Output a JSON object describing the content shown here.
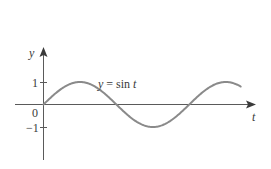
{
  "chart_data": {
    "type": "line",
    "title": "",
    "annotation": "y = sin t",
    "xlabel": "t",
    "ylabel": "y",
    "function": "sin",
    "x_range_radians": [
      0,
      8.5
    ],
    "xlim": [
      -1.2,
      9.1
    ],
    "ylim": [
      -2.4,
      2.5
    ],
    "y_ticks": [
      {
        "value": 1,
        "label": "1"
      },
      {
        "value": 0,
        "label": "0"
      },
      {
        "value": -1,
        "label": "−1"
      }
    ],
    "x_ticks": [],
    "grid": false,
    "legend": null,
    "series": [
      {
        "name": "y = sin t",
        "x": [
          0,
          0.785,
          1.571,
          2.356,
          3.142,
          3.927,
          4.712,
          5.498,
          6.283,
          7.069,
          7.854,
          8.5
        ],
        "values": [
          0,
          0.707,
          1,
          0.707,
          0,
          -0.707,
          -1,
          -0.707,
          0,
          0.707,
          1,
          0.798
        ],
        "color": "#8a8a8a"
      }
    ]
  },
  "labels": {
    "y_axis": "y",
    "x_axis": "t",
    "equation": "y = sin t",
    "tick_one": "1",
    "tick_zero": "0",
    "tick_minus_one": "−1"
  },
  "colors": {
    "axis": "#5a5a5a",
    "curve": "#8a8a8a",
    "text": "#3a3a3a",
    "background": "#ffffff"
  }
}
